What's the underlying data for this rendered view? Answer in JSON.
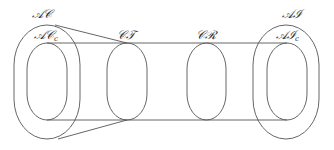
{
  "diagram": {
    "stroke_color": "#555555",
    "labels": {
      "ac": "𝒜𝒞",
      "ac_c_main": "𝒜𝒞",
      "ac_c_sub": "c",
      "ct": "𝒞𝒯",
      "cr": "𝒞ℛ",
      "ai": "𝒜ℐ",
      "ai_c_main": "𝒜ℐ",
      "ai_c_sub": "c"
    },
    "sets": [
      {
        "id": "AC",
        "label": "𝒜𝒞",
        "contains": [
          "AC_c"
        ]
      },
      {
        "id": "AC_c",
        "label": "𝒜𝒞_c"
      },
      {
        "id": "CT",
        "label": "𝒞𝒯"
      },
      {
        "id": "CR",
        "label": "𝒞ℛ"
      },
      {
        "id": "AI",
        "label": "𝒜ℐ",
        "contains": [
          "AI_c"
        ]
      },
      {
        "id": "AI_c",
        "label": "𝒜ℐ_c"
      }
    ]
  }
}
